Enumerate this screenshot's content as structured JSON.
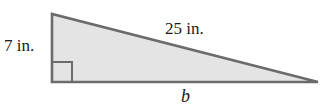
{
  "figure": {
    "kind": "right-triangle-diagram",
    "background_color": "#ffffff",
    "fill_color": "#e4e4e4",
    "stroke_color": "#6b6b6b",
    "text_color": "#1b1b1b",
    "labels": {
      "leg_vertical": "7 in.",
      "hypotenuse": "25 in.",
      "base": "b"
    },
    "geometry": {
      "apex": [
        52,
        14
      ],
      "right_angle_vertex": [
        52,
        82
      ],
      "far_vertex": [
        318,
        82
      ],
      "right_angle_marker_size": 20
    }
  }
}
